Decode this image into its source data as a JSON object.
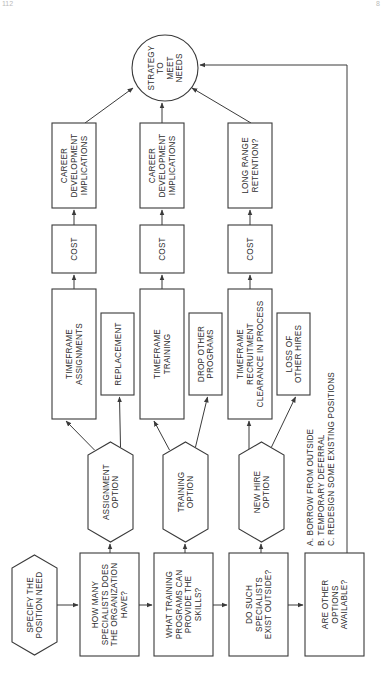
{
  "page": {
    "page_number_left": "112",
    "page_number_right": "8"
  },
  "goal": {
    "label_lines": [
      "STRATEGY",
      "TO",
      "MEET",
      "NEEDS"
    ]
  },
  "start": {
    "label_lines": [
      "SPECIFY THE",
      "POSITION NEED"
    ]
  },
  "questions": [
    {
      "id": "q1",
      "label_lines": [
        "HOW MANY",
        "SPECIALISTS DOES",
        "THE ORGANIZATION",
        "HAVE?"
      ]
    },
    {
      "id": "q2",
      "label_lines": [
        "WHAT TRAINING",
        "PROGRAMS CAN",
        "PROVIDE THE",
        "SKILLS?"
      ]
    },
    {
      "id": "q3",
      "label_lines": [
        "DO SUCH",
        "SPECIALISTS",
        "EXIST OUTSIDE?"
      ]
    },
    {
      "id": "q4",
      "label_lines": [
        "ARE OTHER",
        "OPTIONS",
        "AVAILABLE?"
      ]
    }
  ],
  "options": [
    {
      "id": "assignment",
      "label_lines": [
        "ASSIGNMENT",
        "OPTION"
      ],
      "timeframe_lines": [
        "TIMEFRAME",
        "ASSIGNMENTS"
      ],
      "side_lines": [
        "REPLACEMENT"
      ],
      "cost_lines": [
        "COST"
      ],
      "outcome_lines": [
        "CAREER",
        "DEVELOPMENT",
        "IMPLICATIONS"
      ]
    },
    {
      "id": "training",
      "label_lines": [
        "TRAINING",
        "OPTION"
      ],
      "timeframe_lines": [
        "TIMEFRAME",
        "TRAINING"
      ],
      "side_lines": [
        "DROP OTHER",
        "PROGRAMS"
      ],
      "cost_lines": [
        "COST"
      ],
      "outcome_lines": [
        "CAREER",
        "DEVELOPMENT",
        "IMPLICATIONS"
      ]
    },
    {
      "id": "new-hire",
      "label_lines": [
        "NEW HIRE",
        "OPTION"
      ],
      "timeframe_lines": [
        "TIMEFRAME",
        "RECRUITMENT",
        "CLEARANCE  IN PROCESS"
      ],
      "side_lines": [
        "LOSS OF",
        "OTHER HIRES"
      ],
      "cost_lines": [
        "COST"
      ],
      "outcome_lines": [
        "LONG RANGE",
        "RETENTION?"
      ]
    }
  ],
  "other_options_list": [
    "A. BORROW FROM OUTSIDE",
    "B. TEMPORARY DEFERRAL",
    "C. REDESIGN SOME EXISTING POSITIONS"
  ],
  "colors": {
    "stroke": "#3a3a3a",
    "text": "#2e2e2e",
    "background": "#ffffff"
  }
}
